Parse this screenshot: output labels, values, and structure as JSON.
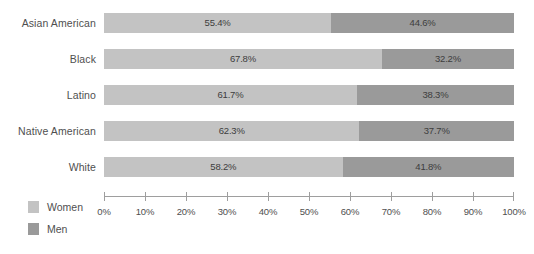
{
  "chart_data": {
    "type": "bar",
    "orientation": "horizontal",
    "stacked": true,
    "normalized_percent": true,
    "title": "",
    "subtitle": "",
    "xlabel": "",
    "ylabel": "",
    "xlim": [
      0,
      100
    ],
    "grid": false,
    "legend_position": "bottom-left",
    "categories": [
      "Asian American",
      "Black",
      "Latino",
      "Native American",
      "White"
    ],
    "series": [
      {
        "name": "Women",
        "color": "#c3c3c3",
        "values": [
          55.4,
          67.8,
          61.7,
          62.3,
          58.2
        ],
        "labels": [
          "55.4%",
          "67.8%",
          "61.7%",
          "62.3%",
          "58.2%"
        ]
      },
      {
        "name": "Men",
        "color": "#9a9a9a",
        "values": [
          44.6,
          32.2,
          38.3,
          37.7,
          41.8
        ],
        "labels": [
          "44.6%",
          "32.2%",
          "38.3%",
          "37.7%",
          "41.8%"
        ]
      }
    ],
    "xticks": [
      0,
      10,
      20,
      30,
      40,
      50,
      60,
      70,
      80,
      90,
      100
    ],
    "xticklabels": [
      "0%",
      "10%",
      "20%",
      "30%",
      "40%",
      "50%",
      "60%",
      "70%",
      "80%",
      "90%",
      "100%"
    ]
  },
  "legend": {
    "items": [
      {
        "label": "Women",
        "color": "#c3c3c3"
      },
      {
        "label": "Men",
        "color": "#9a9a9a"
      }
    ]
  },
  "colors": {
    "women": "#c3c3c3",
    "men": "#9a9a9a",
    "axis": "#9e9e9e",
    "text": "#4f4f4f",
    "background": "#ffffff"
  }
}
